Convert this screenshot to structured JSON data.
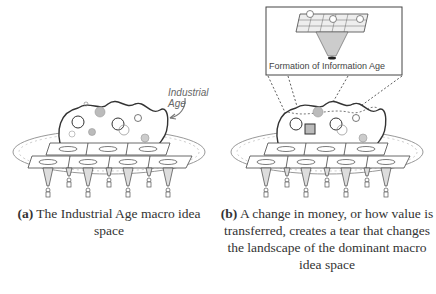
{
  "panels": [
    {
      "id": "a",
      "annotation": "Industrial Age",
      "caption_prefix": "(a)",
      "caption_text": "The Industrial Age macro idea space"
    },
    {
      "id": "b",
      "inset_label": "Formation of Information Age",
      "caption_prefix": "(b)",
      "caption_text": "A change in money, or how value is transferred, creates a tear that changes the landscape of the dominant macro idea space"
    }
  ],
  "colors": {
    "line": "#333333",
    "bubble_fill": "#bdbdbd",
    "ring": "#999999"
  }
}
